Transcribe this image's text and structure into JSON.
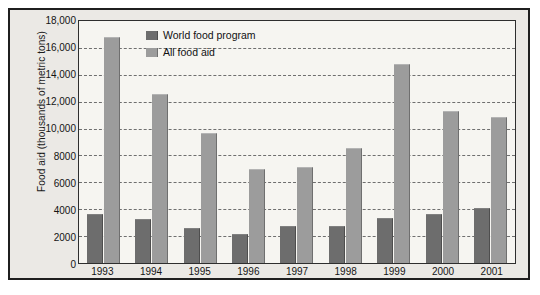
{
  "chart_data": {
    "type": "bar",
    "title": "",
    "xlabel": "",
    "ylabel": "Food aid (thousands of metric tons)",
    "categories": [
      "1993",
      "1994",
      "1995",
      "1996",
      "1997",
      "1998",
      "1999",
      "2000",
      "2001"
    ],
    "series": [
      {
        "name": "World food program",
        "color": "#6d6d6d",
        "values": [
          3600,
          3200,
          2550,
          2100,
          2650,
          2700,
          3300,
          3550,
          4000
        ]
      },
      {
        "name": "All food aid",
        "color": "#9c9c9c",
        "values": [
          16700,
          12500,
          9600,
          6900,
          7100,
          8500,
          14700,
          11200,
          10800
        ]
      }
    ],
    "ylim": [
      0,
      18000
    ],
    "ytick_values": [
      0,
      2000,
      4000,
      6000,
      8000,
      10000,
      12000,
      14000,
      16000,
      18000
    ],
    "ytick_labels": [
      "0",
      "2000",
      "4000",
      "6000",
      "8000",
      "10,000",
      "12,000",
      "14,000",
      "16,000",
      "18,000"
    ],
    "grid": "horizontal-dashed",
    "legend_position": "top-center"
  },
  "legend": {
    "items": [
      {
        "label": "World food program"
      },
      {
        "label": "All food aid"
      }
    ]
  },
  "colors": {
    "world_food_program": "#6d6d6d",
    "all_food_aid": "#9c9c9c",
    "plot_background": "#f6f5f1",
    "figure_background": "#ebe9e5",
    "frame": "#1f1f1f",
    "gridline": "#6f6f6f"
  }
}
